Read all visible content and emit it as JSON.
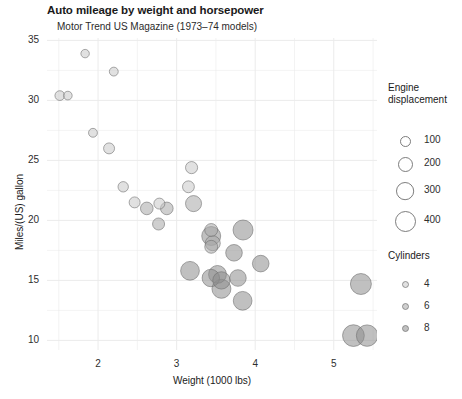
{
  "chart_data": {
    "type": "scatter",
    "title": "Auto mileage by weight and horsepower",
    "subtitle": "Motor Trend US Magazine (1973–74 models)",
    "xlabel": "Weight (1000 lbs)",
    "ylabel": "Miles/(US) gallon",
    "xlim": [
      1.35,
      5.55
    ],
    "ylim": [
      9.2,
      35.2
    ],
    "xticks": [
      2,
      3,
      4,
      5
    ],
    "yticks": [
      10,
      15,
      20,
      25,
      30,
      35
    ],
    "grid": true,
    "grid_color": "#ebebeb",
    "panel_background": "#ffffff",
    "size_encoding": "Engine displacement",
    "color_encoding": "Cylinders",
    "legends": {
      "size": {
        "title_line1": "Engine",
        "title_line2": "displacement",
        "breaks": [
          100,
          200,
          300,
          400
        ],
        "labels": [
          "100",
          "200",
          "300",
          "400"
        ],
        "radii_px": [
          5.0,
          7.0,
          8.6,
          10.0
        ]
      },
      "color": {
        "title": "Cylinders",
        "breaks": [
          4,
          6,
          8
        ],
        "labels": [
          "4",
          "6",
          "8"
        ],
        "colors": [
          "#c8c8c8",
          "#a8a8a8",
          "#8c8c8c"
        ]
      }
    },
    "point_style": {
      "fill_opacity": 0.55,
      "stroke": "#707070",
      "stroke_width": 0.8
    },
    "series": [
      {
        "name": "mtcars",
        "x_field": "wt",
        "y_field": "mpg",
        "size_field": "disp",
        "color_field": "cyl",
        "points": [
          {
            "label": "Mazda RX4",
            "x": 2.62,
            "y": 21.0,
            "size": 160.0,
            "cyl": 6
          },
          {
            "label": "Mazda RX4 Wag",
            "x": 2.875,
            "y": 21.0,
            "size": 160.0,
            "cyl": 6
          },
          {
            "label": "Datsun 710",
            "x": 2.32,
            "y": 22.8,
            "size": 108.0,
            "cyl": 4
          },
          {
            "label": "Hornet 4 Drive",
            "x": 3.215,
            "y": 21.4,
            "size": 258.0,
            "cyl": 6
          },
          {
            "label": "Hornet Sportabout",
            "x": 3.44,
            "y": 18.7,
            "size": 360.0,
            "cyl": 8
          },
          {
            "label": "Valiant",
            "x": 3.46,
            "y": 18.1,
            "size": 225.0,
            "cyl": 6
          },
          {
            "label": "Duster 360",
            "x": 3.57,
            "y": 14.3,
            "size": 360.0,
            "cyl": 8
          },
          {
            "label": "Merc 240D",
            "x": 3.19,
            "y": 24.4,
            "size": 146.7,
            "cyl": 4
          },
          {
            "label": "Merc 230",
            "x": 3.15,
            "y": 22.8,
            "size": 140.8,
            "cyl": 4
          },
          {
            "label": "Merc 280",
            "x": 3.44,
            "y": 19.2,
            "size": 167.6,
            "cyl": 6
          },
          {
            "label": "Merc 280C",
            "x": 3.44,
            "y": 17.8,
            "size": 167.6,
            "cyl": 6
          },
          {
            "label": "Merc 450SE",
            "x": 4.07,
            "y": 16.4,
            "size": 275.8,
            "cyl": 8
          },
          {
            "label": "Merc 450SL",
            "x": 3.73,
            "y": 17.3,
            "size": 275.8,
            "cyl": 8
          },
          {
            "label": "Merc 450SLC",
            "x": 3.78,
            "y": 15.2,
            "size": 275.8,
            "cyl": 8
          },
          {
            "label": "Cadillac Fleetwood",
            "x": 5.25,
            "y": 10.4,
            "size": 472.0,
            "cyl": 8
          },
          {
            "label": "Lincoln Continental",
            "x": 5.424,
            "y": 10.4,
            "size": 460.0,
            "cyl": 8
          },
          {
            "label": "Chrysler Imperial",
            "x": 5.345,
            "y": 14.7,
            "size": 440.0,
            "cyl": 8
          },
          {
            "label": "Fiat 128",
            "x": 2.2,
            "y": 32.4,
            "size": 78.7,
            "cyl": 4
          },
          {
            "label": "Honda Civic",
            "x": 1.615,
            "y": 30.4,
            "size": 75.7,
            "cyl": 4
          },
          {
            "label": "Toyota Corolla",
            "x": 1.835,
            "y": 33.9,
            "size": 71.1,
            "cyl": 4
          },
          {
            "label": "Toyota Corona",
            "x": 2.465,
            "y": 21.5,
            "size": 120.1,
            "cyl": 4
          },
          {
            "label": "Dodge Challenger",
            "x": 3.52,
            "y": 15.5,
            "size": 318.0,
            "cyl": 8
          },
          {
            "label": "AMC Javelin",
            "x": 3.435,
            "y": 15.2,
            "size": 304.0,
            "cyl": 8
          },
          {
            "label": "Camaro Z28",
            "x": 3.84,
            "y": 13.3,
            "size": 350.0,
            "cyl": 8
          },
          {
            "label": "Pontiac Firebird",
            "x": 3.845,
            "y": 19.2,
            "size": 400.0,
            "cyl": 8
          },
          {
            "label": "Fiat X1-9",
            "x": 1.935,
            "y": 27.3,
            "size": 79.0,
            "cyl": 4
          },
          {
            "label": "Porsche 914-2",
            "x": 2.14,
            "y": 26.0,
            "size": 120.3,
            "cyl": 4
          },
          {
            "label": "Lotus Europa",
            "x": 1.513,
            "y": 30.4,
            "size": 95.1,
            "cyl": 4
          },
          {
            "label": "Ford Pantera L",
            "x": 3.17,
            "y": 15.8,
            "size": 351.0,
            "cyl": 8
          },
          {
            "label": "Ferrari Dino",
            "x": 2.77,
            "y": 19.7,
            "size": 145.0,
            "cyl": 6
          },
          {
            "label": "Maserati Bora",
            "x": 3.57,
            "y": 15.0,
            "size": 301.0,
            "cyl": 8
          },
          {
            "label": "Volvo 142E",
            "x": 2.78,
            "y": 21.4,
            "size": 121.0,
            "cyl": 4
          }
        ]
      }
    ]
  }
}
